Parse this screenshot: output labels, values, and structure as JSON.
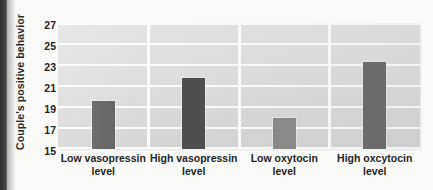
{
  "chart_data": {
    "type": "bar",
    "title": "",
    "xlabel": "",
    "ylabel": "Couple's positive behavior",
    "categories": [
      "Low vasopressin level",
      "High vasopressin level",
      "Low oxytocin level",
      "High oxcytocin level"
    ],
    "category_lines": [
      [
        "Low vasopressin",
        "level"
      ],
      [
        "High vasopressin",
        "level"
      ],
      [
        "Low oxytocin",
        "level"
      ],
      [
        "High oxcytocin",
        "level"
      ]
    ],
    "values": [
      19.6,
      21.8,
      18.0,
      23.3
    ],
    "ylim": [
      15,
      27
    ],
    "ytick_step": 2,
    "yticks": [
      "27",
      "25",
      "23",
      "21",
      "19",
      "17",
      "15"
    ],
    "ytick_values": [
      27,
      25,
      23,
      21,
      19,
      17,
      15
    ],
    "grid": true,
    "grid_color": "#fdfdfd",
    "legend": "none",
    "plot_background": "#dedede",
    "bar_colors": [
      "#585858",
      "#4f4f4f",
      "#8b8b8b",
      "#6e6e6e"
    ]
  },
  "figure": {
    "page_edge_color": "#343536"
  }
}
